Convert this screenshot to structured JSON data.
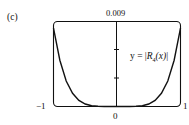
{
  "panel": {
    "label": "(c)"
  },
  "axes": {
    "y_max_label": "0.009",
    "x_min_label": "−1",
    "x_zero_label": "0",
    "x_max_label": "1"
  },
  "equation": {
    "prefix": "y = |",
    "func": "R",
    "subscript": "4",
    "arg": "(x)",
    "suffix": "|"
  },
  "chart_data": {
    "type": "line",
    "title": "",
    "xlabel": "",
    "ylabel": "",
    "series": [
      {
        "name": "y = |R4(x)|",
        "x": [
          -1.0,
          -0.9,
          -0.8,
          -0.7,
          -0.6,
          -0.5,
          -0.4,
          -0.3,
          -0.2,
          -0.1,
          0.0,
          0.1,
          0.2,
          0.3,
          0.4,
          0.5,
          0.6,
          0.7,
          0.8,
          0.9,
          1.0
        ],
        "y": [
          0.0083,
          0.0049,
          0.0027,
          0.0014,
          0.00065,
          0.00026,
          8.5e-05,
          2e-05,
          3e-06,
          0.0,
          0.0,
          0.0,
          3e-06,
          2e-05,
          8.5e-05,
          0.00026,
          0.00065,
          0.0014,
          0.0027,
          0.0049,
          0.0083
        ]
      }
    ],
    "xlim": [
      -1,
      1
    ],
    "ylim": [
      0,
      0.009
    ],
    "x_ticks": [
      -1,
      0,
      1
    ],
    "y_ticks": [
      0.003,
      0.006
    ],
    "y_tick_labels_shown": [
      "0.009"
    ],
    "annotations": [
      "y = |R4(x)|",
      "(c)"
    ],
    "grid": false,
    "legend": "none"
  }
}
